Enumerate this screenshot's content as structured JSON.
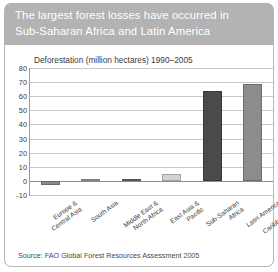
{
  "title": "The largest forest losses have occurred in\nSub-Saharan Africa and Latin America",
  "source": "Source: FAO Global Forest Resources Assessment 2005",
  "chart_data": {
    "type": "bar",
    "title": "Deforestation (million hectares) 1990–2005",
    "xlabel": "",
    "ylabel": "",
    "ylim": [
      -10,
      80
    ],
    "yticks": [
      80,
      70,
      60,
      50,
      40,
      30,
      20,
      10,
      0,
      -10
    ],
    "grid": true,
    "legend": "none",
    "categories": [
      "Europe &\nCentral Asia",
      "South Asia",
      "Middle East &\nNorth Africa",
      "East Asia &\nPacific",
      "Sub-Saharan Africa",
      "Latin America &\nCaribbean"
    ],
    "values": [
      -3,
      1,
      1,
      5,
      64,
      68.5
    ],
    "colors": [
      "#8a8a8a",
      "#a3a3a3",
      "#6f6f6f",
      "#d2d2d2",
      "#4a4a4a",
      "#8c8c8c"
    ]
  }
}
